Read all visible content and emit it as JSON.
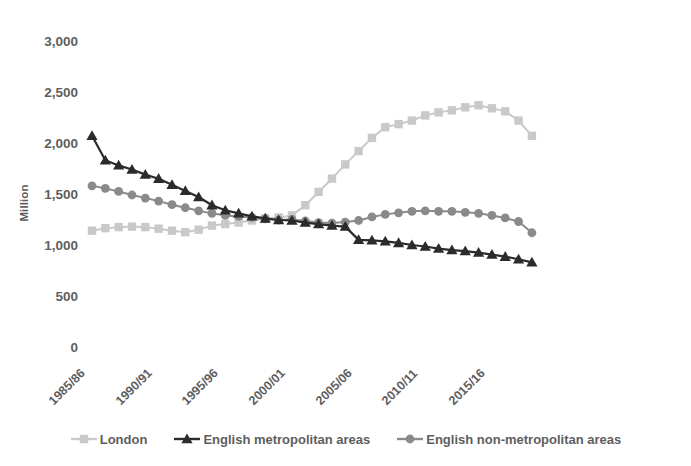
{
  "chart_data": {
    "type": "line",
    "title": "",
    "subtitle": "",
    "xlabel": "",
    "ylabel": "Million",
    "ylim": [
      0,
      3000
    ],
    "yticks": [
      0,
      500,
      1000,
      1500,
      2000,
      2500,
      3000
    ],
    "ytick_labels": [
      "0",
      "500",
      "1,000",
      "1,500",
      "2,000",
      "2,500",
      "3,000"
    ],
    "grid": false,
    "legend_position": "bottom",
    "x": [
      "1985/86",
      "1986/87",
      "1987/88",
      "1988/89",
      "1989/90",
      "1990/91",
      "1991/92",
      "1992/93",
      "1993/94",
      "1994/95",
      "1995/96",
      "1996/97",
      "1997/98",
      "1998/99",
      "1999/00",
      "2000/01",
      "2001/02",
      "2002/03",
      "2003/04",
      "2004/05",
      "2005/06",
      "2006/07",
      "2007/08",
      "2008/09",
      "2009/10",
      "2010/11",
      "2011/12",
      "2012/13",
      "2013/14",
      "2014/15",
      "2015/16",
      "2016/17",
      "2017/18",
      "2018/19"
    ],
    "xtick_labels": [
      "1985/86",
      "1990/91",
      "1995/96",
      "2000/01",
      "2005/06",
      "2010/11",
      "2015/16"
    ],
    "xtick_indices": [
      0,
      5,
      10,
      15,
      20,
      25,
      30
    ],
    "series": [
      {
        "name": "London",
        "marker": "square",
        "color": "#c9c9c9",
        "values": [
          1150,
          1175,
          1185,
          1190,
          1185,
          1170,
          1150,
          1135,
          1160,
          1200,
          1215,
          1230,
          1250,
          1270,
          1280,
          1300,
          1400,
          1530,
          1660,
          1800,
          1930,
          2060,
          2165,
          2195,
          2230,
          2280,
          2310,
          2330,
          2360,
          2380,
          2350,
          2320,
          2230,
          2080
        ]
      },
      {
        "name": "English metropolitan areas",
        "marker": "triangle",
        "color": "#2b2b2b",
        "values": [
          2080,
          1840,
          1790,
          1750,
          1700,
          1660,
          1600,
          1540,
          1480,
          1400,
          1350,
          1320,
          1290,
          1270,
          1255,
          1250,
          1230,
          1215,
          1200,
          1190,
          1060,
          1055,
          1045,
          1030,
          1010,
          995,
          975,
          960,
          950,
          935,
          915,
          895,
          870,
          840
        ]
      },
      {
        "name": "English non-metropolitan areas",
        "marker": "circle",
        "color": "#8a8a8a",
        "values": [
          1590,
          1565,
          1535,
          1500,
          1470,
          1440,
          1405,
          1375,
          1345,
          1320,
          1300,
          1290,
          1280,
          1265,
          1255,
          1260,
          1245,
          1230,
          1225,
          1235,
          1250,
          1285,
          1310,
          1325,
          1340,
          1345,
          1340,
          1340,
          1330,
          1320,
          1300,
          1275,
          1240,
          1130
        ]
      }
    ]
  },
  "legend": {
    "items": [
      {
        "label": "London"
      },
      {
        "label": "English metropolitan areas"
      },
      {
        "label": "English non-metropolitan areas"
      }
    ]
  }
}
